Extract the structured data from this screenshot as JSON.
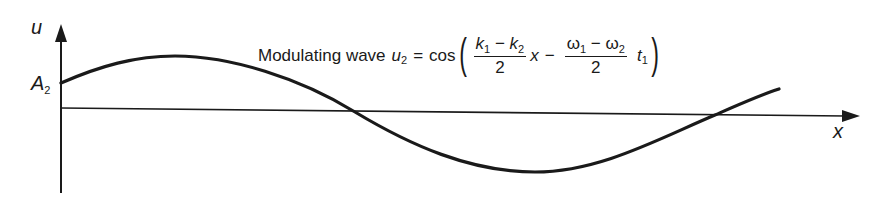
{
  "figure": {
    "axis_labels": {
      "y": "u",
      "x": "x"
    },
    "amplitude_label": {
      "main": "A",
      "sub": "2"
    },
    "equation": {
      "prefix": "Modulating wave",
      "lhs_var": "u",
      "lhs_sub": "2",
      "equals": "=",
      "func": "cos",
      "open_paren": "(",
      "close_paren": ")",
      "frac1": {
        "num_a": "k",
        "num_a_sub": "1",
        "minus": "−",
        "num_b": "k",
        "num_b_sub": "2",
        "den": "2"
      },
      "var1": "x",
      "minus": "−",
      "frac2": {
        "num_a": "ω",
        "num_a_sub": "1",
        "minus": "−",
        "num_b": "ω",
        "num_b_sub": "2",
        "den": "2"
      },
      "var2": "t",
      "var2_sub": "1"
    },
    "colors": {
      "ink": "#1a1a1a",
      "background": "#ffffff"
    }
  }
}
